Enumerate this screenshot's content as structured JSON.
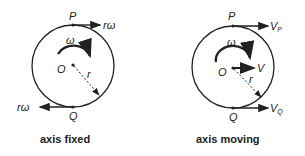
{
  "diagrams": [
    {
      "caption": "axis fixed",
      "labels": {
        "top_point": "P",
        "bottom_point": "Q",
        "center": "O",
        "radius": "r",
        "angular_velocity": "ω",
        "top_velocity": "rω",
        "bottom_velocity": "rω"
      }
    },
    {
      "caption": "axis moving",
      "labels": {
        "top_point": "P",
        "bottom_point": "Q",
        "center": "O",
        "radius": "r",
        "angular_velocity": "ω",
        "center_velocity": "V",
        "top_velocity_main": "V",
        "top_velocity_sub": "P",
        "bottom_velocity_main": "V",
        "bottom_velocity_sub": "Q"
      }
    }
  ],
  "colors": {
    "stroke": "#222222",
    "background": "#ffffff"
  }
}
